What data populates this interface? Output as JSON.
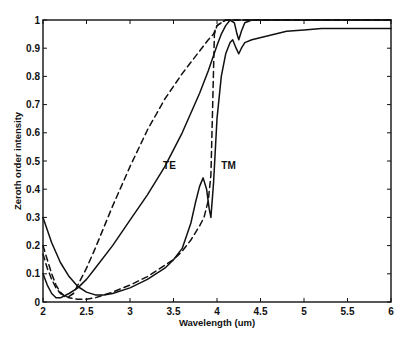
{
  "chart_data": {
    "type": "line",
    "title": "",
    "xlabel": "Wavelength (um)",
    "ylabel": "Zeroth order intensity",
    "xlim": [
      2,
      6
    ],
    "ylim": [
      0,
      1
    ],
    "xticks": [
      2,
      2.5,
      3,
      3.5,
      4,
      4.5,
      5,
      5.5,
      6
    ],
    "xtick_labels": [
      "2",
      "2.5",
      "3",
      "3.5",
      "4",
      "4.5",
      "5",
      "5.5",
      "6"
    ],
    "yticks": [
      0,
      0.1,
      0.2,
      0.3,
      0.4,
      0.5,
      0.6,
      0.7,
      0.8,
      0.9,
      1
    ],
    "ytick_labels": [
      "0",
      "0.1",
      "0.2",
      "0.3",
      "0.4",
      "0.5",
      "0.6",
      "0.7",
      "0.8",
      "0.9",
      "1"
    ],
    "grid": false,
    "legend": null,
    "annotations": [
      {
        "text": "TE",
        "x": 3.38,
        "y": 0.47
      },
      {
        "text": "TM",
        "x": 4.05,
        "y": 0.47
      }
    ],
    "series": [
      {
        "name": "TE (solid)",
        "style": "solid",
        "x": [
          2.0,
          2.05,
          2.1,
          2.15,
          2.2,
          2.3,
          2.4,
          2.5,
          2.6,
          2.8,
          3.0,
          3.2,
          3.4,
          3.6,
          3.8,
          3.9,
          4.0,
          4.05,
          4.1,
          4.15,
          4.2,
          4.23,
          4.25,
          4.28,
          4.32,
          4.4,
          4.6,
          5.0,
          5.5,
          6.0
        ],
        "y": [
          0.1,
          0.06,
          0.03,
          0.015,
          0.015,
          0.03,
          0.05,
          0.08,
          0.12,
          0.2,
          0.29,
          0.38,
          0.48,
          0.6,
          0.74,
          0.82,
          0.91,
          0.95,
          0.98,
          1.0,
          0.99,
          0.95,
          0.93,
          0.96,
          0.99,
          1.0,
          1.0,
          1.0,
          1.0,
          1.0
        ]
      },
      {
        "name": "TM (solid)",
        "style": "solid",
        "x": [
          2.0,
          2.1,
          2.2,
          2.3,
          2.4,
          2.5,
          2.6,
          2.7,
          2.8,
          3.0,
          3.2,
          3.4,
          3.5,
          3.6,
          3.7,
          3.75,
          3.8,
          3.84,
          3.88,
          3.91,
          3.93,
          3.96,
          4.0,
          4.05,
          4.1,
          4.15,
          4.18,
          4.22,
          4.25,
          4.28,
          4.32,
          4.4,
          4.6,
          4.8,
          5.0,
          5.2,
          5.5,
          6.0
        ],
        "y": [
          0.3,
          0.21,
          0.14,
          0.09,
          0.055,
          0.035,
          0.025,
          0.025,
          0.03,
          0.05,
          0.08,
          0.12,
          0.15,
          0.19,
          0.28,
          0.35,
          0.41,
          0.44,
          0.4,
          0.33,
          0.3,
          0.42,
          0.65,
          0.8,
          0.88,
          0.92,
          0.93,
          0.9,
          0.88,
          0.9,
          0.92,
          0.93,
          0.945,
          0.96,
          0.965,
          0.97,
          0.97,
          0.97
        ]
      },
      {
        "name": "TE (dashed)",
        "style": "dashed",
        "x": [
          2.0,
          2.05,
          2.1,
          2.15,
          2.2,
          2.25,
          2.3,
          2.35,
          2.4,
          2.5,
          2.6,
          2.8,
          3.0,
          3.2,
          3.4,
          3.6,
          3.8,
          3.9,
          3.96,
          4.0,
          4.1,
          4.5,
          5.0,
          6.0
        ],
        "y": [
          0.2,
          0.15,
          0.1,
          0.06,
          0.035,
          0.02,
          0.02,
          0.03,
          0.06,
          0.12,
          0.19,
          0.34,
          0.48,
          0.61,
          0.72,
          0.81,
          0.89,
          0.93,
          0.95,
          0.98,
          1.0,
          1.0,
          1.0,
          1.0
        ]
      },
      {
        "name": "TM (dashed)",
        "style": "dashed",
        "x": [
          2.0,
          2.05,
          2.1,
          2.15,
          2.2,
          2.3,
          2.4,
          2.5,
          2.6,
          2.8,
          3.0,
          3.2,
          3.4,
          3.5,
          3.6,
          3.7,
          3.8,
          3.85,
          3.9,
          3.93,
          3.95,
          3.97,
          4.0,
          4.1,
          4.5,
          5.0,
          6.0
        ],
        "y": [
          0.17,
          0.12,
          0.08,
          0.05,
          0.03,
          0.015,
          0.01,
          0.01,
          0.015,
          0.035,
          0.06,
          0.09,
          0.13,
          0.15,
          0.18,
          0.22,
          0.27,
          0.3,
          0.36,
          0.45,
          0.7,
          0.95,
          0.98,
          1.0,
          1.0,
          1.0,
          1.0
        ]
      }
    ]
  },
  "layout": {
    "plot_left_px": 43,
    "plot_right_px": 391,
    "plot_top_px": 20,
    "plot_bottom_px": 302,
    "line_color": "#111111",
    "background": "#ffffff"
  }
}
